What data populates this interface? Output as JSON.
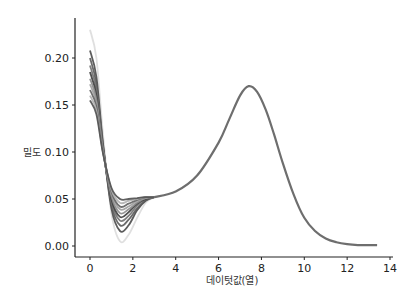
{
  "chart_data": {
    "type": "line",
    "title": "",
    "xlabel": "데이텃값(열)",
    "ylabel": "밀도",
    "xlim": [
      -0.7,
      14.1
    ],
    "ylim": [
      -0.01,
      0.24
    ],
    "xticks": [
      0,
      2,
      4,
      6,
      8,
      10,
      12,
      14
    ],
    "yticks": [
      0.0,
      0.05,
      0.1,
      0.15,
      0.2
    ],
    "ytick_labels": [
      "0.00",
      "0.05",
      "0.10",
      "0.15",
      "0.20"
    ],
    "grid": false,
    "legend": null,
    "series": [
      {
        "name": "s1",
        "color": "#dcdcdc",
        "x": [
          0,
          0.3,
          0.6,
          1.0,
          1.4,
          1.8,
          2.2,
          2.6,
          3.0
        ],
        "y": [
          0.23,
          0.2,
          0.12,
          0.035,
          0.005,
          0.012,
          0.03,
          0.046,
          0.052
        ]
      },
      {
        "name": "s2",
        "color": "#4a4a4a",
        "x": [
          0,
          0.3,
          0.6,
          1.0,
          1.4,
          1.8,
          2.2,
          2.6,
          3.0
        ],
        "y": [
          0.208,
          0.18,
          0.11,
          0.04,
          0.016,
          0.022,
          0.038,
          0.048,
          0.052
        ]
      },
      {
        "name": "s3",
        "color": "#5a5a5a",
        "x": [
          0,
          0.3,
          0.6,
          1.0,
          1.4,
          1.8,
          2.2,
          2.6,
          3.0
        ],
        "y": [
          0.2,
          0.172,
          0.108,
          0.044,
          0.022,
          0.028,
          0.04,
          0.049,
          0.052
        ]
      },
      {
        "name": "s4",
        "color": "#707070",
        "x": [
          0,
          0.3,
          0.6,
          1.0,
          1.4,
          1.8,
          2.2,
          2.6,
          3.0
        ],
        "y": [
          0.192,
          0.166,
          0.106,
          0.047,
          0.027,
          0.032,
          0.043,
          0.05,
          0.052
        ]
      },
      {
        "name": "s5",
        "color": "#3c3c3c",
        "x": [
          0,
          0.3,
          0.6,
          1.0,
          1.4,
          1.8,
          2.2,
          2.6,
          3.0
        ],
        "y": [
          0.185,
          0.16,
          0.104,
          0.05,
          0.031,
          0.036,
          0.045,
          0.05,
          0.052
        ]
      },
      {
        "name": "s6",
        "color": "#8a8a8a",
        "x": [
          0,
          0.3,
          0.6,
          1.0,
          1.4,
          1.8,
          2.2,
          2.6,
          3.0
        ],
        "y": [
          0.178,
          0.156,
          0.103,
          0.053,
          0.035,
          0.039,
          0.046,
          0.051,
          0.052
        ]
      },
      {
        "name": "s7",
        "color": "#9c9c9c",
        "x": [
          0,
          0.3,
          0.6,
          1.0,
          1.4,
          1.8,
          2.2,
          2.6,
          3.0
        ],
        "y": [
          0.172,
          0.152,
          0.102,
          0.056,
          0.039,
          0.042,
          0.048,
          0.051,
          0.052
        ]
      },
      {
        "name": "s8",
        "color": "#606060",
        "x": [
          0,
          0.3,
          0.6,
          1.0,
          1.4,
          1.8,
          2.2,
          2.6,
          3.0
        ],
        "y": [
          0.166,
          0.148,
          0.101,
          0.058,
          0.042,
          0.045,
          0.049,
          0.052,
          0.052
        ]
      },
      {
        "name": "s9",
        "color": "#b0b0b0",
        "x": [
          0,
          0.3,
          0.6,
          1.0,
          1.4,
          1.8,
          2.2,
          2.6,
          3.0
        ],
        "y": [
          0.16,
          0.144,
          0.1,
          0.06,
          0.046,
          0.048,
          0.05,
          0.052,
          0.052
        ]
      },
      {
        "name": "s10",
        "color": "#505050",
        "x": [
          0,
          0.3,
          0.6,
          1.0,
          1.4,
          1.8,
          2.2,
          2.6,
          3.0
        ],
        "y": [
          0.155,
          0.14,
          0.099,
          0.062,
          0.05,
          0.05,
          0.051,
          0.052,
          0.052
        ]
      }
    ],
    "shared_tail": {
      "color": "#6e6e6e",
      "x": [
        3.0,
        4.0,
        5.0,
        6.0,
        6.5,
        7.0,
        7.4,
        7.8,
        8.2,
        8.6,
        9.0,
        9.5,
        10.0,
        10.5,
        11.0,
        11.5,
        12.0,
        12.5,
        13.0,
        13.4
      ],
      "y": [
        0.052,
        0.058,
        0.075,
        0.11,
        0.135,
        0.16,
        0.17,
        0.164,
        0.145,
        0.118,
        0.088,
        0.055,
        0.03,
        0.016,
        0.008,
        0.004,
        0.002,
        0.001,
        0.001,
        0.001
      ]
    }
  }
}
